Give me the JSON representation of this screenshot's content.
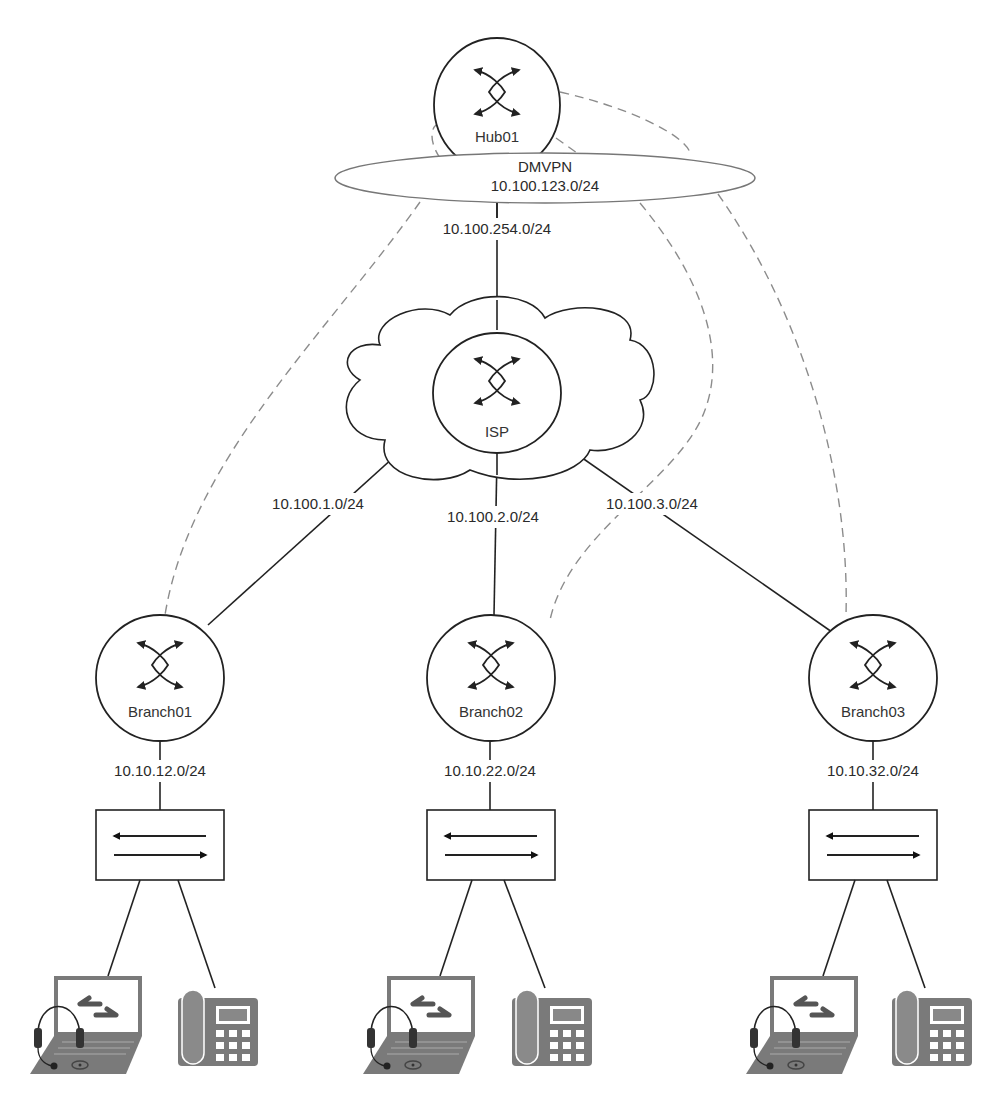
{
  "diagram": {
    "title": "",
    "type": "network-topology",
    "nodes": {
      "hub": {
        "label": "Hub01",
        "type": "router"
      },
      "isp": {
        "label": "ISP",
        "type": "router",
        "container": "cloud"
      },
      "branch01": {
        "label": "Branch01",
        "type": "router"
      },
      "branch02": {
        "label": "Branch02",
        "type": "router"
      },
      "branch03": {
        "label": "Branch03",
        "type": "router"
      },
      "switch01": {
        "type": "switch"
      },
      "switch02": {
        "type": "switch"
      },
      "switch03": {
        "type": "switch"
      }
    },
    "dmvpn": {
      "name": "DMVPN",
      "subnet": "10.100.123.0/24"
    },
    "links": {
      "hub_isp": "10.100.254.0/24",
      "isp_branch01": "10.100.1.0/24",
      "isp_branch02": "10.100.2.0/24",
      "isp_branch03": "10.100.3.0/24",
      "branch01_lan": "10.10.12.0/24",
      "branch02_lan": "10.10.22.0/24",
      "branch03_lan": "10.10.32.0/24"
    },
    "tunnels": [
      {
        "from": "Hub01",
        "to": "Branch01",
        "style": "dashed"
      },
      {
        "from": "Hub01",
        "to": "Branch02",
        "style": "dashed"
      },
      {
        "from": "Hub01",
        "to": "Branch03",
        "style": "dashed"
      }
    ],
    "endpoints": [
      {
        "site": "Branch01",
        "devices": [
          "laptop-with-headset",
          "ip-phone"
        ]
      },
      {
        "site": "Branch02",
        "devices": [
          "laptop-with-headset",
          "ip-phone"
        ]
      },
      {
        "site": "Branch03",
        "devices": [
          "laptop-with-headset",
          "ip-phone"
        ]
      }
    ],
    "colors": {
      "line": "#222222",
      "tunnel": "#8c8c8c",
      "device": "#7a7a7a"
    }
  }
}
